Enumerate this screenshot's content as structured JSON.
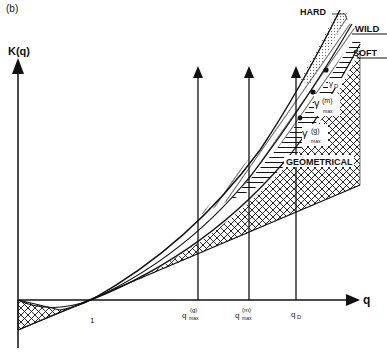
{
  "figure": {
    "panel_label": "(b)",
    "y_axis_label": "K(q)",
    "x_axis_label": "q",
    "x_ticks": {
      "one": "1",
      "qmax_g": {
        "base": "q",
        "sup": "(g)",
        "sub": "max"
      },
      "qmax_m": {
        "base": "q",
        "sup": "(m)",
        "sub": "max"
      },
      "qD": {
        "base": "q",
        "sub": "D"
      }
    },
    "regions": {
      "hard": "HARD",
      "wild": "WILD",
      "soft": "SOFT",
      "geometrical": "GEOMETRICAL"
    },
    "gamma_labels": {
      "gD": {
        "base": "γ",
        "sub": "D"
      },
      "gmax_m": {
        "base": "γ",
        "sup": "(m)",
        "sub": "max"
      },
      "gmax_g": {
        "base": "γ",
        "sup": "(g)",
        "sub": "max"
      }
    }
  }
}
